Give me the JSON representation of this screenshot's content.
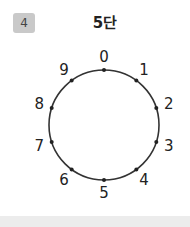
{
  "problem": {
    "number": "4",
    "title": "5단"
  },
  "diagram": {
    "center": [
      104,
      125
    ],
    "radius": 55,
    "stroke_color": "#333333",
    "labels": [
      "0",
      "1",
      "2",
      "3",
      "4",
      "5",
      "6",
      "7",
      "8",
      "9"
    ]
  }
}
